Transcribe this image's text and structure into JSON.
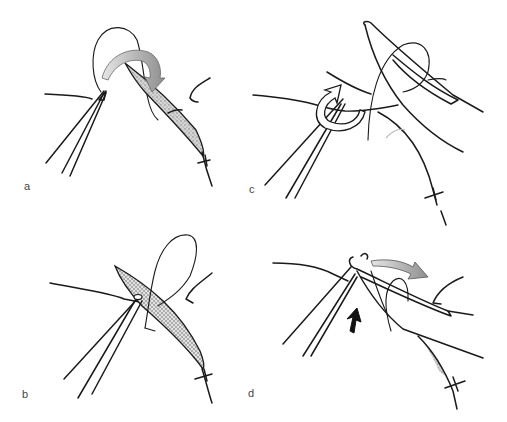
{
  "figure": {
    "panels": [
      {
        "id": "a",
        "label": "a",
        "position": "top-left",
        "content": "forceps holding thread loop; curved shaded arrow indicates needle passing over; shaded tissue wound edge with suture knot"
      },
      {
        "id": "c",
        "label": "c",
        "position": "top-right",
        "content": "needle holder jaw over thread loop; open curled arrow indicating wrap around forceps"
      },
      {
        "id": "b",
        "label": "b",
        "position": "bottom-left",
        "content": "forceps at tissue edge with thread loop; cross-hatched shaded tissue flap; suture knot"
      },
      {
        "id": "d",
        "label": "d",
        "position": "bottom-right",
        "content": "needle holder with loop wrapped around; shaded arrow pointing right; black arrow pointing upward"
      }
    ],
    "colors": {
      "ink": "#1a1a1a",
      "shading": "#9a9a9a",
      "arrow_fill": "#a8a8a8",
      "black_arrow": "#111111",
      "background": "#ffffff"
    }
  }
}
